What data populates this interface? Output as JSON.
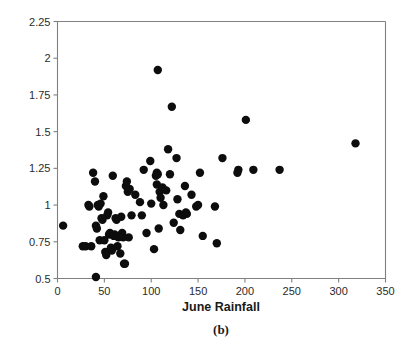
{
  "chart_data": {
    "type": "scatter",
    "title": "",
    "caption": "(b)",
    "xlabel": "June Rainfall",
    "ylabel": "Annual Ring Width",
    "xlim": [
      0,
      350
    ],
    "ylim": [
      0.5,
      2.25
    ],
    "xticks": [
      0,
      50,
      100,
      150,
      200,
      250,
      300,
      350
    ],
    "yticks": [
      0.5,
      0.75,
      1,
      1.25,
      1.5,
      1.75,
      2,
      2.25
    ],
    "xtick_labels": [
      "0",
      "50",
      "100",
      "150",
      "200",
      "250",
      "300",
      "350"
    ],
    "ytick_labels": [
      "0.5",
      "0.75",
      "1",
      "1.25",
      "1.5",
      "1.75",
      "2",
      "2.25"
    ],
    "grid": false,
    "legend": false,
    "marker": "filled-circle",
    "marker_color": "#0d0d0d",
    "marker_size": 4.2,
    "points": [
      [
        6,
        0.86
      ],
      [
        27,
        0.72
      ],
      [
        30,
        0.72
      ],
      [
        33,
        1.0
      ],
      [
        34,
        0.99
      ],
      [
        36,
        0.72
      ],
      [
        38,
        1.22
      ],
      [
        40,
        1.16
      ],
      [
        41,
        0.51
      ],
      [
        41,
        0.86
      ],
      [
        42,
        0.84
      ],
      [
        43,
        1.0
      ],
      [
        44,
        0.99
      ],
      [
        45,
        0.76
      ],
      [
        46,
        1.01
      ],
      [
        47,
        0.91
      ],
      [
        48,
        0.9
      ],
      [
        49,
        1.06
      ],
      [
        50,
        0.76
      ],
      [
        51,
        0.68
      ],
      [
        52,
        0.66
      ],
      [
        53,
        0.93
      ],
      [
        54,
        0.95
      ],
      [
        55,
        0.8
      ],
      [
        56,
        0.81
      ],
      [
        57,
        0.71
      ],
      [
        58,
        0.69
      ],
      [
        59,
        1.2
      ],
      [
        60,
        0.79
      ],
      [
        61,
        0.8
      ],
      [
        62,
        0.91
      ],
      [
        63,
        0.9
      ],
      [
        64,
        0.72
      ],
      [
        65,
        0.78
      ],
      [
        66,
        0.79
      ],
      [
        67,
        0.67
      ],
      [
        68,
        0.92
      ],
      [
        69,
        0.81
      ],
      [
        70,
        0.78
      ],
      [
        71,
        0.6
      ],
      [
        72,
        0.6
      ],
      [
        73,
        1.13
      ],
      [
        74,
        1.16
      ],
      [
        75,
        1.09
      ],
      [
        76,
        0.78
      ],
      [
        77,
        1.11
      ],
      [
        79,
        0.93
      ],
      [
        83,
        1.07
      ],
      [
        88,
        1.02
      ],
      [
        90,
        0.93
      ],
      [
        92,
        1.24
      ],
      [
        95,
        0.81
      ],
      [
        99,
        1.3
      ],
      [
        100,
        1.01
      ],
      [
        103,
        0.7
      ],
      [
        105,
        1.2
      ],
      [
        106,
        1.14
      ],
      [
        106,
        1.22
      ],
      [
        107,
        1.92
      ],
      [
        107,
        1.21
      ],
      [
        108,
        0.84
      ],
      [
        109,
        1.09
      ],
      [
        110,
        1.05
      ],
      [
        112,
        1.12
      ],
      [
        113,
        1.0
      ],
      [
        116,
        1.1
      ],
      [
        118,
        1.38
      ],
      [
        120,
        1.21
      ],
      [
        122,
        1.67
      ],
      [
        124,
        0.88
      ],
      [
        127,
        1.32
      ],
      [
        128,
        1.04
      ],
      [
        130,
        0.94
      ],
      [
        131,
        0.83
      ],
      [
        134,
        0.93
      ],
      [
        136,
        1.13
      ],
      [
        137,
        0.95
      ],
      [
        138,
        0.94
      ],
      [
        143,
        1.07
      ],
      [
        148,
        0.99
      ],
      [
        150,
        1.0
      ],
      [
        152,
        1.22
      ],
      [
        155,
        0.79
      ],
      [
        168,
        0.99
      ],
      [
        170,
        0.74
      ],
      [
        176,
        1.32
      ],
      [
        192,
        1.22
      ],
      [
        193,
        1.24
      ],
      [
        201,
        1.58
      ],
      [
        209,
        1.24
      ],
      [
        237,
        1.24
      ],
      [
        318,
        1.42
      ]
    ]
  },
  "colors": {
    "axis": "#808080",
    "text": "#1a1a1a",
    "marker": "#0d0d0d",
    "background": "#ffffff"
  }
}
